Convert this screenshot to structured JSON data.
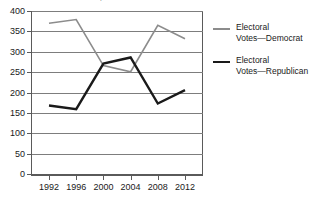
{
  "chart_data": {
    "type": "line",
    "title": "Elections, 1992–2012",
    "xlabel": "",
    "ylabel": "",
    "categories": [
      "1992",
      "1996",
      "2000",
      "2004",
      "2008",
      "2012"
    ],
    "x": [
      1992,
      1996,
      2000,
      2004,
      2008,
      2012
    ],
    "series": [
      {
        "name": "Electoral Votes—Democrat",
        "legend_line1": "Electoral",
        "legend_line2": "Votes—Democrat",
        "color": "#8c8c8c",
        "line_width": 1.6,
        "values": [
          370,
          379,
          266,
          251,
          365,
          332
        ]
      },
      {
        "name": "Electoral Votes—Republican",
        "legend_line1": "Electoral",
        "legend_line2": "Votes—Republican",
        "color": "#1a1a1a",
        "line_width": 2.4,
        "values": [
          168,
          159,
          271,
          286,
          173,
          206
        ]
      }
    ],
    "ylim": [
      0,
      400
    ],
    "yticks": [
      0,
      50,
      100,
      150,
      200,
      250,
      300,
      350,
      400
    ],
    "ytick_labels": [
      "0",
      "50",
      "100",
      "150",
      "200",
      "250",
      "300",
      "350",
      "400"
    ],
    "grid": true,
    "grid_color": "#7d7d7d",
    "legend_position": "right",
    "background": "#ffffff"
  }
}
